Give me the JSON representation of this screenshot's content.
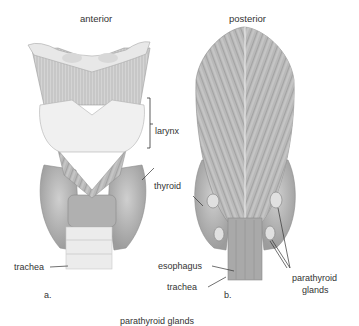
{
  "panel_a": {
    "heading": "anterior",
    "figure_label": "a.",
    "labels": {
      "larynx": "larynx",
      "thyroid": "thyroid",
      "trachea": "trachea"
    }
  },
  "panel_b": {
    "heading": "posterior",
    "figure_label": "b.",
    "labels": {
      "esophagus": "esophagus",
      "trachea": "trachea",
      "parathyroid_line1": "parathyroid",
      "parathyroid_line2": "glands"
    }
  },
  "cutoff_caption": "parathyroid glands",
  "colors": {
    "tissue_light": "#e6e6e6",
    "tissue_mid": "#bdbdbd",
    "tissue_dark": "#9a9a9a",
    "gland": "#cfcfcf",
    "line": "#333333"
  }
}
